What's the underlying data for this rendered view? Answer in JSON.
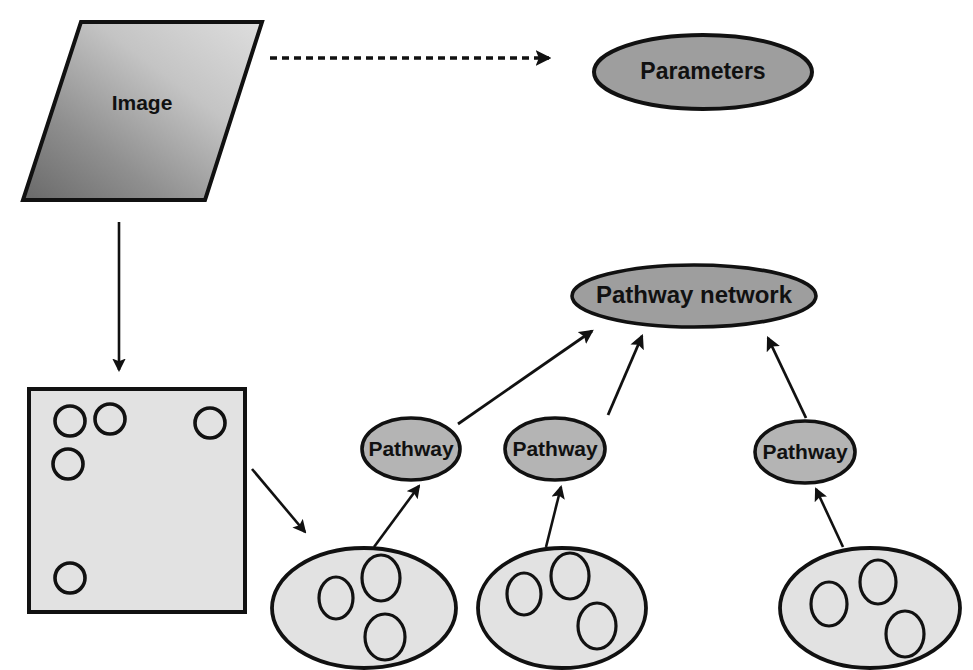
{
  "diagram": {
    "colors": {
      "stroke": "#111111",
      "gray_fill": "#9e9e9e",
      "light_fill": "#e2e2e2",
      "image_gradient_light": "#d6d6d6",
      "image_gradient_dark": "#6e6e6e",
      "background": "#ffffff"
    },
    "nodes": {
      "image": {
        "label": "Image",
        "shape": "parallelogram",
        "points": "81,22 262,22 205,200 23,200",
        "label_x": 142,
        "label_y": 103
      },
      "parameters": {
        "label": "Parameters",
        "shape": "ellipse",
        "cx": 703,
        "cy": 72,
        "rx": 109,
        "ry": 37
      },
      "pathway_network": {
        "label": "Pathway network",
        "shape": "ellipse",
        "cx": 694,
        "cy": 296,
        "rx": 122,
        "ry": 31
      },
      "object_map": {
        "label": "",
        "shape": "rect",
        "x": 29,
        "y": 389,
        "width": 216,
        "height": 223,
        "circles": [
          {
            "cx": 70,
            "cy": 421,
            "r": 15
          },
          {
            "cx": 110,
            "cy": 419,
            "r": 15
          },
          {
            "cx": 210,
            "cy": 423,
            "r": 15
          },
          {
            "cx": 68,
            "cy": 464,
            "r": 15
          },
          {
            "cx": 70,
            "cy": 578,
            "r": 15
          }
        ]
      },
      "pathways": [
        {
          "label": "Pathway",
          "cx": 411,
          "cy": 449,
          "rx": 49,
          "ry": 31
        },
        {
          "label": "Pathway",
          "cx": 555,
          "cy": 449,
          "rx": 50,
          "ry": 31
        },
        {
          "label": "Pathway",
          "cx": 805,
          "cy": 452,
          "rx": 50,
          "ry": 31
        }
      ],
      "clusters": [
        {
          "label": "",
          "cx": 364,
          "cy": 608,
          "rx": 92,
          "ry": 60,
          "circles": [
            {
              "cx": 336,
              "cy": 598,
              "rx": 17,
              "ry": 21
            },
            {
              "cx": 381,
              "cy": 578,
              "rx": 19,
              "ry": 23
            },
            {
              "cx": 385,
              "cy": 637,
              "rx": 20,
              "ry": 23
            }
          ]
        },
        {
          "label": "",
          "cx": 562,
          "cy": 608,
          "rx": 84,
          "ry": 60,
          "circles": [
            {
              "cx": 524,
              "cy": 594,
              "rx": 17,
              "ry": 21
            },
            {
              "cx": 570,
              "cy": 576,
              "rx": 19,
              "ry": 23
            },
            {
              "cx": 597,
              "cy": 626,
              "rx": 19,
              "ry": 23
            }
          ]
        },
        {
          "label": "",
          "cx": 870,
          "cy": 608,
          "rx": 90,
          "ry": 60,
          "circles": [
            {
              "cx": 829,
              "cy": 604,
              "rx": 18,
              "ry": 22
            },
            {
              "cx": 878,
              "cy": 582,
              "rx": 18,
              "ry": 22
            },
            {
              "cx": 905,
              "cy": 634,
              "rx": 19,
              "ry": 23
            }
          ]
        }
      ]
    },
    "edges": [
      {
        "name": "image-to-parameters",
        "style": "dashed",
        "x1": 270,
        "y1": 58,
        "x2": 549,
        "y2": 58
      },
      {
        "name": "image-to-object-map",
        "style": "solid",
        "x1": 119,
        "y1": 222,
        "x2": 119,
        "y2": 370
      },
      {
        "name": "object-map-to-cluster-1",
        "style": "solid",
        "x1": 252,
        "y1": 469,
        "x2": 305,
        "y2": 532
      },
      {
        "name": "cluster-1-to-pathway-1",
        "style": "solid",
        "x1": 374,
        "y1": 547,
        "x2": 417,
        "y2": 485
      },
      {
        "name": "cluster-2-to-pathway-2",
        "style": "solid",
        "x1": 546,
        "y1": 547,
        "x2": 560,
        "y2": 486
      },
      {
        "name": "cluster-3-to-pathway-3",
        "style": "solid",
        "x1": 843,
        "y1": 547,
        "x2": 815,
        "y2": 488
      },
      {
        "name": "pathway-1-to-network",
        "style": "solid",
        "x1": 458,
        "y1": 424,
        "x2": 590,
        "y2": 330
      },
      {
        "name": "pathway-2-to-network",
        "style": "solid",
        "x1": 608,
        "y1": 415,
        "x2": 641,
        "y2": 335
      },
      {
        "name": "pathway-3-to-network",
        "style": "solid",
        "x1": 806,
        "y1": 418,
        "x2": 767,
        "y2": 337
      }
    ]
  }
}
